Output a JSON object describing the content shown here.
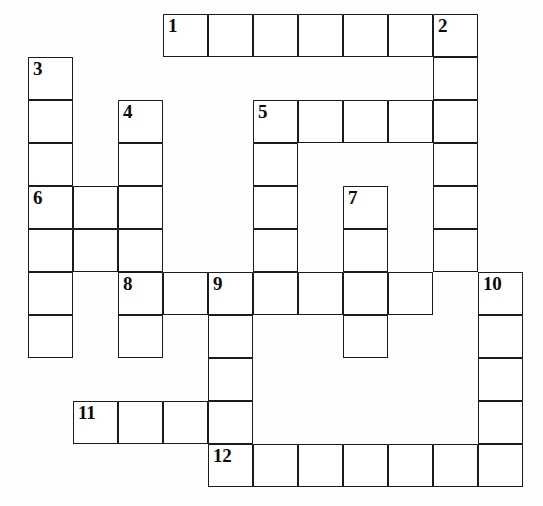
{
  "puzzle": {
    "type": "crossword-grid",
    "title": "",
    "columns": 12,
    "rows": 11,
    "cell_width": 45,
    "cell_height": 43,
    "origin_x": 28,
    "origin_y": 14,
    "cell_fill": "#ffffff",
    "cell_border": "#1b1b1b",
    "background": "#fefefe",
    "clue_numbers": [
      "1",
      "2",
      "3",
      "4",
      "5",
      "6",
      "7",
      "8",
      "9",
      "10",
      "11",
      "12"
    ],
    "cells": [
      {
        "r": 0,
        "c": 3,
        "n": "1",
        "v": ""
      },
      {
        "r": 0,
        "c": 4,
        "n": "",
        "v": ""
      },
      {
        "r": 0,
        "c": 5,
        "n": "",
        "v": ""
      },
      {
        "r": 0,
        "c": 6,
        "n": "",
        "v": ""
      },
      {
        "r": 0,
        "c": 7,
        "n": "",
        "v": ""
      },
      {
        "r": 0,
        "c": 8,
        "n": "",
        "v": ""
      },
      {
        "r": 0,
        "c": 9,
        "n": "2",
        "v": ""
      },
      {
        "r": 1,
        "c": 0,
        "n": "3",
        "v": ""
      },
      {
        "r": 1,
        "c": 9,
        "n": "",
        "v": ""
      },
      {
        "r": 2,
        "c": 0,
        "n": "",
        "v": ""
      },
      {
        "r": 2,
        "c": 2,
        "n": "4",
        "v": ""
      },
      {
        "r": 2,
        "c": 5,
        "n": "5",
        "v": ""
      },
      {
        "r": 2,
        "c": 6,
        "n": "",
        "v": ""
      },
      {
        "r": 2,
        "c": 7,
        "n": "",
        "v": ""
      },
      {
        "r": 2,
        "c": 8,
        "n": "",
        "v": ""
      },
      {
        "r": 2,
        "c": 9,
        "n": "",
        "v": ""
      },
      {
        "r": 3,
        "c": 0,
        "n": "",
        "v": ""
      },
      {
        "r": 3,
        "c": 2,
        "n": "",
        "v": ""
      },
      {
        "r": 3,
        "c": 5,
        "n": "",
        "v": ""
      },
      {
        "r": 3,
        "c": 9,
        "n": "",
        "v": ""
      },
      {
        "r": 4,
        "c": 0,
        "n": "6",
        "v": ""
      },
      {
        "r": 4,
        "c": 1,
        "n": "",
        "v": ""
      },
      {
        "r": 4,
        "c": 2,
        "n": "",
        "v": ""
      },
      {
        "r": 4,
        "c": 5,
        "n": "",
        "v": ""
      },
      {
        "r": 4,
        "c": 7,
        "n": "7",
        "v": ""
      },
      {
        "r": 4,
        "c": 9,
        "n": "",
        "v": ""
      },
      {
        "r": 5,
        "c": 0,
        "n": "",
        "v": ""
      },
      {
        "r": 5,
        "c": 1,
        "n": "",
        "v": ""
      },
      {
        "r": 5,
        "c": 2,
        "n": "",
        "v": ""
      },
      {
        "r": 5,
        "c": 5,
        "n": "",
        "v": ""
      },
      {
        "r": 5,
        "c": 7,
        "n": "",
        "v": ""
      },
      {
        "r": 5,
        "c": 9,
        "n": "",
        "v": ""
      },
      {
        "r": 6,
        "c": 0,
        "n": "",
        "v": ""
      },
      {
        "r": 6,
        "c": 2,
        "n": "8",
        "v": ""
      },
      {
        "r": 6,
        "c": 3,
        "n": "",
        "v": ""
      },
      {
        "r": 6,
        "c": 4,
        "n": "9",
        "v": ""
      },
      {
        "r": 6,
        "c": 5,
        "n": "",
        "v": ""
      },
      {
        "r": 6,
        "c": 6,
        "n": "",
        "v": ""
      },
      {
        "r": 6,
        "c": 7,
        "n": "",
        "v": ""
      },
      {
        "r": 6,
        "c": 8,
        "n": "",
        "v": ""
      },
      {
        "r": 6,
        "c": 10,
        "n": "10",
        "v": ""
      },
      {
        "r": 7,
        "c": 0,
        "n": "",
        "v": ""
      },
      {
        "r": 7,
        "c": 2,
        "n": "",
        "v": ""
      },
      {
        "r": 7,
        "c": 4,
        "n": "",
        "v": ""
      },
      {
        "r": 7,
        "c": 7,
        "n": "",
        "v": ""
      },
      {
        "r": 7,
        "c": 10,
        "n": "",
        "v": ""
      },
      {
        "r": 8,
        "c": 4,
        "n": "",
        "v": ""
      },
      {
        "r": 8,
        "c": 10,
        "n": "",
        "v": ""
      },
      {
        "r": 9,
        "c": 1,
        "n": "11",
        "v": ""
      },
      {
        "r": 9,
        "c": 2,
        "n": "",
        "v": ""
      },
      {
        "r": 9,
        "c": 3,
        "n": "",
        "v": ""
      },
      {
        "r": 9,
        "c": 4,
        "n": "",
        "v": ""
      },
      {
        "r": 9,
        "c": 10,
        "n": "",
        "v": ""
      },
      {
        "r": 10,
        "c": 4,
        "n": "12",
        "v": ""
      },
      {
        "r": 10,
        "c": 5,
        "n": "",
        "v": ""
      },
      {
        "r": 10,
        "c": 6,
        "n": "",
        "v": ""
      },
      {
        "r": 10,
        "c": 7,
        "n": "",
        "v": ""
      },
      {
        "r": 10,
        "c": 8,
        "n": "",
        "v": ""
      },
      {
        "r": 10,
        "c": 9,
        "n": "",
        "v": ""
      },
      {
        "r": 10,
        "c": 10,
        "n": "",
        "v": ""
      }
    ]
  }
}
